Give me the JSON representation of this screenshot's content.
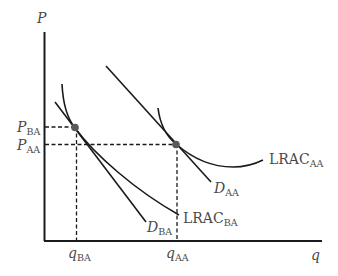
{
  "diagram": {
    "type": "economics-cost-demand",
    "axes": {
      "y_label": "P",
      "x_label": "q"
    },
    "price_labels": [
      {
        "main": "P",
        "sub": "BA"
      },
      {
        "main": "P",
        "sub": "AA"
      }
    ],
    "quantity_labels": [
      {
        "main": "q",
        "sub": "BA"
      },
      {
        "main": "q",
        "sub": "AA"
      }
    ],
    "curves": {
      "d_aa": {
        "main": "D",
        "sub": "AA"
      },
      "d_ba": {
        "main": "D",
        "sub": "BA"
      },
      "lrac_aa": {
        "main": "LRAC",
        "sub": "AA"
      },
      "lrac_ba": {
        "main": "LRAC",
        "sub": "BA"
      }
    },
    "equilibria": [
      {
        "name": "BA",
        "description": "tangency of D_BA and LRAC_BA at (q_BA, P_BA)"
      },
      {
        "name": "AA",
        "description": "tangency of D_AA and LRAC_AA at (q_AA, P_AA)"
      }
    ],
    "colors": {
      "line": "#1a1a1a",
      "text": "#4a4a4a",
      "point": "#5a5a5a",
      "background": "#ffffff"
    }
  }
}
